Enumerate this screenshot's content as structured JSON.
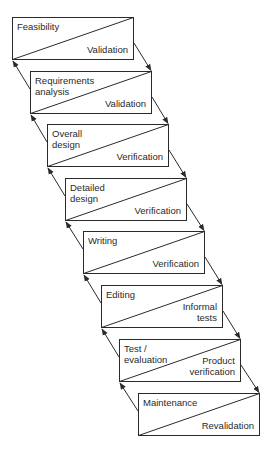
{
  "diagram": {
    "type": "waterfall-lifecycle",
    "stages": [
      {
        "label": "Feasibility",
        "check": "Validation"
      },
      {
        "label": "Requirements\nanalysis",
        "check": "Validation"
      },
      {
        "label": "Overall\ndesign",
        "check": "Verification"
      },
      {
        "label": "Detailed\ndesign",
        "check": "Verification"
      },
      {
        "label": "Writing",
        "check": "Verification"
      },
      {
        "label": "Editing",
        "check": "Informal\ntests"
      },
      {
        "label": "Test /\nevaluation",
        "check": "Product\nverification"
      },
      {
        "label": "Maintenance",
        "check": "Revalidation"
      }
    ],
    "colors": {
      "line": "#2a2a2a",
      "background": "#ffffff"
    }
  }
}
